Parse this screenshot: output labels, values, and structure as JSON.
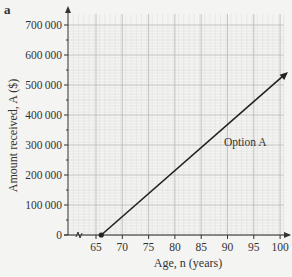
{
  "part": "a",
  "chart_data": {
    "type": "line",
    "title": "",
    "xlabel": "Age, n (years)",
    "ylabel": "Amount received, A ($)",
    "xlim": [
      60,
      102
    ],
    "ylim": [
      0,
      700000
    ],
    "x_ticks": [
      "65",
      "70",
      "75",
      "80",
      "85",
      "90",
      "95",
      "100"
    ],
    "y_ticks": [
      "0",
      "100 000",
      "200 000",
      "300 000",
      "400 000",
      "500 000",
      "600 000",
      "700 000"
    ],
    "grid": true,
    "axis_break": "x",
    "series": [
      {
        "name": "Option A",
        "x": [
          66,
          101.5
        ],
        "y": [
          0,
          543000
        ],
        "arrow_end": true,
        "start_marker": "dot"
      }
    ],
    "annotations": [
      {
        "text": "Option A",
        "x": 91,
        "y": 320000
      }
    ]
  },
  "colors": {
    "line": "#222222",
    "grid_major": "#b8b8b8",
    "grid_minor": "#dcdcdc",
    "background": "#f4f4f2"
  }
}
